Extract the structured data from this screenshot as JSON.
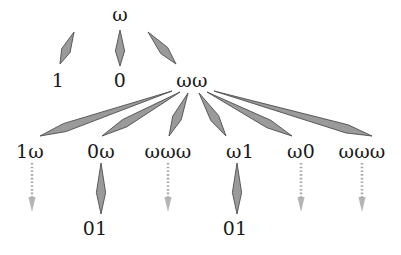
{
  "figure": {
    "type": "derivation-tree",
    "background_color": "#ffffff",
    "text_color": "#1a1a1a",
    "arrow_fill": "#9a9a9a",
    "arrow_stroke": "#4d4d4d",
    "dotted_arrow_color": "#a8a8a8"
  },
  "nodes": [
    {
      "id": "root",
      "label": "ω",
      "x": 120,
      "y": 14,
      "row": 0
    },
    {
      "id": "n1",
      "label": "1",
      "x": 58,
      "y": 80,
      "row": 1
    },
    {
      "id": "n0",
      "label": "0",
      "x": 120,
      "y": 80,
      "row": 1
    },
    {
      "id": "nww",
      "label": "ωω",
      "x": 192,
      "y": 80,
      "row": 1
    },
    {
      "id": "c1",
      "label": "1ω",
      "x": 30,
      "y": 151,
      "row": 2
    },
    {
      "id": "c2",
      "label": "0ω",
      "x": 101,
      "y": 151,
      "row": 2
    },
    {
      "id": "c3",
      "label": "ωωω",
      "x": 168,
      "y": 151,
      "row": 2
    },
    {
      "id": "c4",
      "label": "ω1",
      "x": 240,
      "y": 151,
      "row": 2
    },
    {
      "id": "c5",
      "label": "ω0",
      "x": 301,
      "y": 151,
      "row": 2
    },
    {
      "id": "c6",
      "label": "ωωω",
      "x": 362,
      "y": 151,
      "row": 2
    },
    {
      "id": "l1",
      "label": "01",
      "x": 95,
      "y": 228,
      "row": 3
    },
    {
      "id": "l2",
      "label": "01",
      "x": 235,
      "y": 228,
      "row": 3
    }
  ],
  "edges": [
    {
      "from": "root",
      "to": "n1",
      "style": "solid",
      "x1": 74,
      "y1": 32,
      "x2": 60,
      "y2": 64
    },
    {
      "from": "root",
      "to": "n0",
      "style": "solid",
      "x1": 120,
      "y1": 30,
      "x2": 120,
      "y2": 66
    },
    {
      "from": "root",
      "to": "nww",
      "style": "solid",
      "x1": 148,
      "y1": 32,
      "x2": 176,
      "y2": 64
    },
    {
      "from": "nww",
      "to": "c1",
      "style": "solid",
      "x1": 172,
      "y1": 91,
      "x2": 40,
      "y2": 136
    },
    {
      "from": "nww",
      "to": "c2",
      "style": "solid",
      "x1": 180,
      "y1": 92,
      "x2": 102,
      "y2": 136
    },
    {
      "from": "nww",
      "to": "c3",
      "style": "solid",
      "x1": 188,
      "y1": 93,
      "x2": 169,
      "y2": 136
    },
    {
      "from": "nww",
      "to": "c4",
      "style": "solid",
      "x1": 199,
      "y1": 93,
      "x2": 226,
      "y2": 136
    },
    {
      "from": "nww",
      "to": "c5",
      "style": "solid",
      "x1": 207,
      "y1": 92,
      "x2": 292,
      "y2": 136
    },
    {
      "from": "nww",
      "to": "c6",
      "style": "solid",
      "x1": 214,
      "y1": 91,
      "x2": 372,
      "y2": 136
    },
    {
      "from": "c1",
      "to": null,
      "style": "dotted",
      "x1": 32,
      "y1": 163,
      "x2": 32,
      "y2": 212
    },
    {
      "from": "c2",
      "to": "l1",
      "style": "solid",
      "x1": 101,
      "y1": 163,
      "x2": 101,
      "y2": 214
    },
    {
      "from": "c3",
      "to": null,
      "style": "dotted",
      "x1": 168,
      "y1": 163,
      "x2": 168,
      "y2": 212
    },
    {
      "from": "c4",
      "to": "l2",
      "style": "solid",
      "x1": 237,
      "y1": 163,
      "x2": 237,
      "y2": 214
    },
    {
      "from": "c5",
      "to": null,
      "style": "dotted",
      "x1": 301,
      "y1": 163,
      "x2": 301,
      "y2": 212
    },
    {
      "from": "c6",
      "to": null,
      "style": "dotted",
      "x1": 362,
      "y1": 163,
      "x2": 362,
      "y2": 212
    }
  ]
}
